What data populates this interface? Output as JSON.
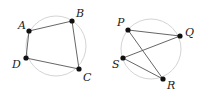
{
  "figures": [
    {
      "name": "quadrilateral-abcd",
      "circle": {
        "cx": 56,
        "cy": 46,
        "r": 30
      },
      "points": [
        {
          "label": "A",
          "x": 29,
          "y": 31,
          "lx": 18,
          "ly": 29
        },
        {
          "label": "B",
          "x": 72,
          "y": 21,
          "lx": 76,
          "ly": 17
        },
        {
          "label": "C",
          "x": 79,
          "y": 69,
          "lx": 83,
          "ly": 81
        },
        {
          "label": "D",
          "x": 26,
          "y": 58,
          "lx": 12,
          "ly": 68
        }
      ],
      "edges": [
        [
          "A",
          "B"
        ],
        [
          "B",
          "C"
        ],
        [
          "C",
          "D"
        ],
        [
          "D",
          "A"
        ]
      ]
    },
    {
      "name": "crossed-quadrilateral-pqrs",
      "circle": {
        "cx": 151,
        "cy": 49,
        "r": 30
      },
      "points": [
        {
          "label": "P",
          "x": 128,
          "y": 30,
          "lx": 117,
          "ly": 26
        },
        {
          "label": "Q",
          "x": 180,
          "y": 36,
          "lx": 185,
          "ly": 36
        },
        {
          "label": "R",
          "x": 163,
          "y": 79,
          "lx": 167,
          "ly": 89
        },
        {
          "label": "S",
          "x": 123,
          "y": 58,
          "lx": 112,
          "ly": 68
        }
      ],
      "edges": [
        [
          "P",
          "Q"
        ],
        [
          "Q",
          "S"
        ],
        [
          "S",
          "R"
        ],
        [
          "R",
          "P"
        ]
      ]
    }
  ],
  "colors": {
    "circle": "#d4d4d4",
    "edge": "#555555",
    "point": "#111111",
    "label": "#222222"
  }
}
